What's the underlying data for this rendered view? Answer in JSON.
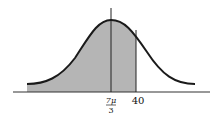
{
  "figure": {
    "curve": {
      "mean_x": 111,
      "left_x": 27,
      "right_x": 195,
      "peak_y": 20,
      "tail_y": 84,
      "stroke": "#1a1a1a"
    },
    "axis": {
      "y": 92,
      "x_start": 13,
      "x_end": 210,
      "stroke": "#333333"
    },
    "mean_line": {
      "x": 111,
      "y_top": 8,
      "y_bottom": 92
    },
    "shaded_region": {
      "x_from": 27,
      "x_to": 136,
      "fill": "#b5b5b5"
    },
    "boundary_line": {
      "x": 136
    },
    "labels": {
      "mean_numerator": "7μ",
      "mean_denominator": "3",
      "boundary": "40"
    }
  }
}
